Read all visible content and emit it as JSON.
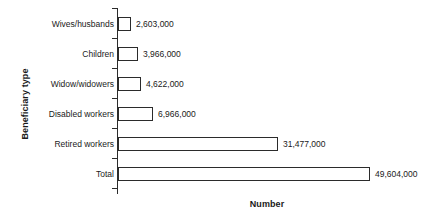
{
  "chart_data": {
    "type": "bar",
    "orientation": "horizontal",
    "title": "",
    "xlabel": "Number",
    "ylabel": "Beneficiary type",
    "grid": false,
    "legend": "none",
    "xlim": [
      0,
      49604000
    ],
    "categories": [
      "Wives/husbands",
      "Children",
      "Widow/widowers",
      "Disabled workers",
      "Retired workers",
      "Total"
    ],
    "values": [
      2603000,
      3966000,
      4622000,
      6966000,
      31477000,
      49604000
    ],
    "value_labels": [
      "2,603,000",
      "3,966,000",
      "4,622,000",
      "6,966,000",
      "31,477,000",
      "49,604,000"
    ],
    "bar_fill_color": "#ffffff",
    "bar_edge_color": "#2b2b2b",
    "background_color": "#ffffff"
  }
}
